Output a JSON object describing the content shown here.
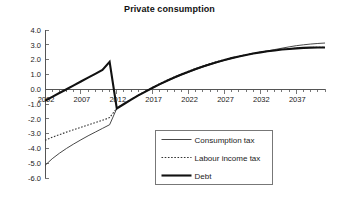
{
  "chart_data": {
    "type": "line",
    "title": "Private consumption",
    "xlabel": "",
    "ylabel": "",
    "xlim": [
      2002,
      2041
    ],
    "ylim": [
      -6.0,
      4.0
    ],
    "grid": false,
    "legend_position": "bottom-right",
    "x_tick_labels": [
      "2002",
      "2007",
      "2012",
      "2017",
      "2022",
      "2027",
      "2032",
      "2037"
    ],
    "x_tick_values": [
      2002,
      2007,
      2012,
      2017,
      2022,
      2027,
      2032,
      2037
    ],
    "x_minor_tick_step": 1,
    "y_tick_labels": [
      "4.0",
      "3.0",
      "2.0",
      "1.0",
      "0.0",
      "-1.0",
      "-2.0",
      "-3.0",
      "-4.0",
      "-5.0",
      "-6.0"
    ],
    "y_tick_values": [
      4.0,
      3.0,
      2.0,
      1.0,
      0.0,
      -1.0,
      -2.0,
      -3.0,
      -4.0,
      -5.0,
      -6.0
    ],
    "x": [
      2002,
      2003,
      2004,
      2005,
      2006,
      2007,
      2008,
      2009,
      2010,
      2011,
      2012,
      2013,
      2014,
      2015,
      2016,
      2017,
      2018,
      2019,
      2020,
      2021,
      2022,
      2023,
      2024,
      2025,
      2026,
      2027,
      2028,
      2029,
      2030,
      2031,
      2032,
      2033,
      2034,
      2035,
      2036,
      2037,
      2038,
      2039,
      2040,
      2041
    ],
    "series": [
      {
        "name": "Consumption tax",
        "style": "solid-thin",
        "color": "#333333",
        "values": [
          -5.15,
          -4.7,
          -4.33,
          -4.0,
          -3.7,
          -3.42,
          -3.15,
          -2.9,
          -2.65,
          -2.4,
          -1.3,
          -1.0,
          -0.7,
          -0.42,
          -0.16,
          0.08,
          0.32,
          0.55,
          0.76,
          0.96,
          1.15,
          1.33,
          1.5,
          1.66,
          1.81,
          1.95,
          2.08,
          2.2,
          2.31,
          2.41,
          2.5,
          2.59,
          2.68,
          2.77,
          2.86,
          2.94,
          3.0,
          3.05,
          3.09,
          3.12
        ]
      },
      {
        "name": "Labour income tax",
        "style": "dotted",
        "color": "#333333",
        "values": [
          -3.45,
          -3.25,
          -3.07,
          -2.9,
          -2.74,
          -2.58,
          -2.42,
          -2.26,
          -2.1,
          -1.92,
          -1.28,
          -0.98,
          -0.68,
          -0.4,
          -0.13,
          0.13,
          0.38,
          0.61,
          0.83,
          1.03,
          1.22,
          1.4,
          1.57,
          1.73,
          1.87,
          2.0,
          2.12,
          2.23,
          2.33,
          2.42,
          2.5,
          2.57,
          2.63,
          2.69,
          2.73,
          2.77,
          2.8,
          2.82,
          2.83,
          2.83
        ]
      },
      {
        "name": "Debt",
        "style": "solid-thick",
        "color": "#111111",
        "values": [
          -0.78,
          -0.52,
          -0.26,
          0.0,
          0.26,
          0.52,
          0.78,
          1.04,
          1.3,
          1.85,
          -1.3,
          -1.0,
          -0.7,
          -0.42,
          -0.16,
          0.1,
          0.34,
          0.57,
          0.79,
          0.99,
          1.18,
          1.36,
          1.53,
          1.69,
          1.84,
          1.97,
          2.1,
          2.21,
          2.31,
          2.41,
          2.49,
          2.56,
          2.62,
          2.68,
          2.72,
          2.76,
          2.79,
          2.81,
          2.82,
          2.82
        ]
      }
    ],
    "legend_entries": [
      {
        "label": "Consumption tax",
        "style": "solid-thin"
      },
      {
        "label": "Labour income tax",
        "style": "dotted"
      },
      {
        "label": "Debt",
        "style": "solid-thick"
      }
    ]
  }
}
